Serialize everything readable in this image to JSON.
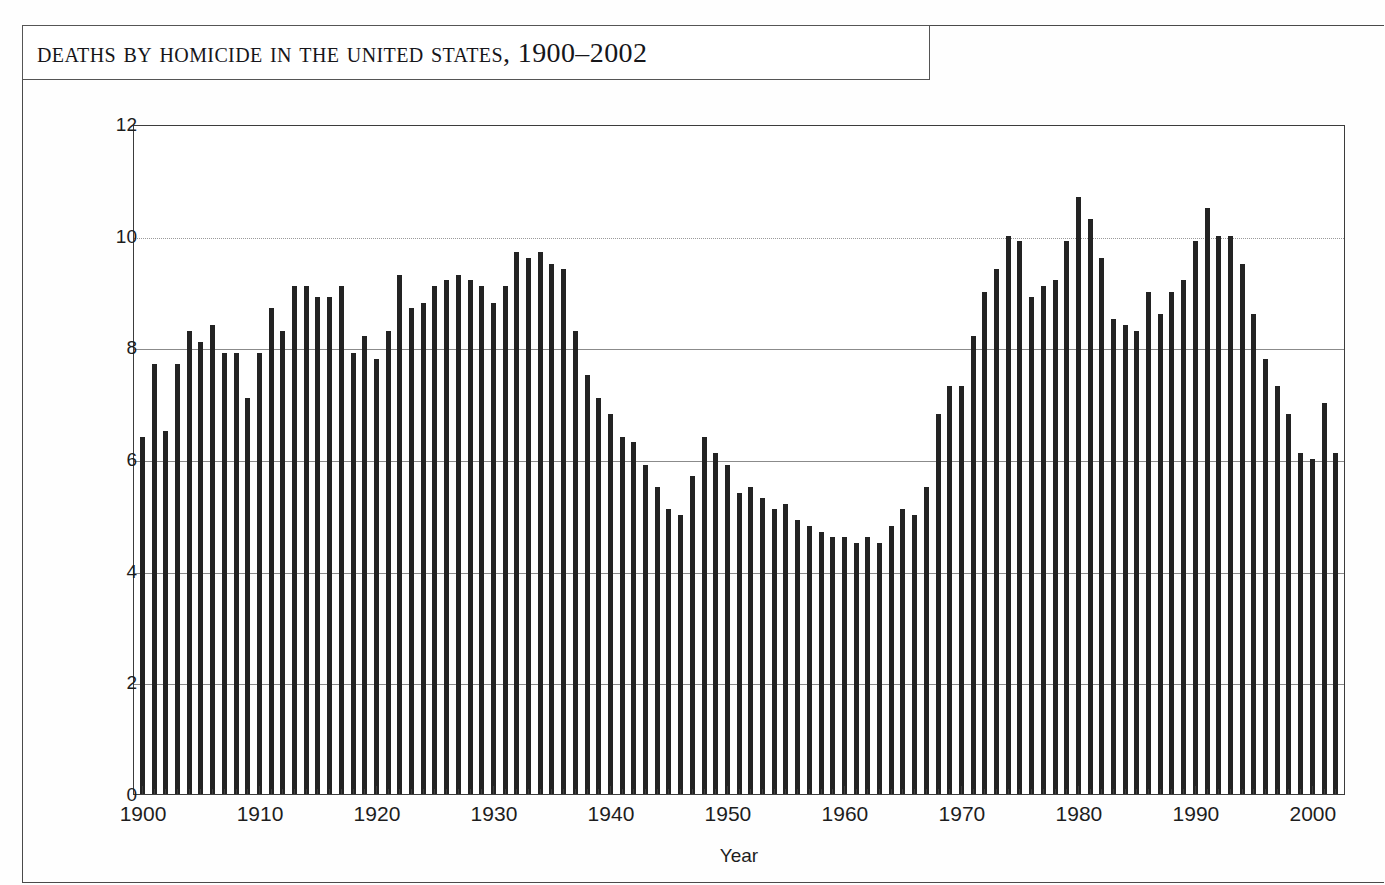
{
  "page": {
    "title_box_label": "Deaths by Homicide in the United States, 1900–2002"
  },
  "chart_data": {
    "type": "bar",
    "title": "Deaths by Homicide in the United States, 1900–2002",
    "xlabel": "Year",
    "ylabel": "Rate per 100,000 Residents",
    "ylim": [
      0,
      12
    ],
    "xlim": [
      1900,
      2002
    ],
    "ytick_labels": [
      "0",
      "2",
      "4",
      "6",
      "8",
      "10",
      "12"
    ],
    "ytick_values": [
      0,
      2,
      4,
      6,
      8,
      10,
      12
    ],
    "xtick_labels": [
      "1900",
      "1910",
      "1920",
      "1930",
      "1940",
      "1950",
      "1960",
      "1970",
      "1980",
      "1990",
      "2000"
    ],
    "xtick_values": [
      1900,
      1910,
      1920,
      1930,
      1940,
      1950,
      1960,
      1970,
      1980,
      1990,
      2000
    ],
    "grid": "horizontal",
    "legend": "none",
    "bar_color": "#232323",
    "categories": [
      1900,
      1901,
      1902,
      1903,
      1904,
      1905,
      1906,
      1907,
      1908,
      1909,
      1910,
      1911,
      1912,
      1913,
      1914,
      1915,
      1916,
      1917,
      1918,
      1919,
      1920,
      1921,
      1922,
      1923,
      1924,
      1925,
      1926,
      1927,
      1928,
      1929,
      1930,
      1931,
      1932,
      1933,
      1934,
      1935,
      1936,
      1937,
      1938,
      1939,
      1940,
      1941,
      1942,
      1943,
      1944,
      1945,
      1946,
      1947,
      1948,
      1949,
      1950,
      1951,
      1952,
      1953,
      1954,
      1955,
      1956,
      1957,
      1958,
      1959,
      1960,
      1961,
      1962,
      1963,
      1964,
      1965,
      1966,
      1967,
      1968,
      1969,
      1970,
      1971,
      1972,
      1973,
      1974,
      1975,
      1976,
      1977,
      1978,
      1979,
      1980,
      1981,
      1982,
      1983,
      1984,
      1985,
      1986,
      1987,
      1988,
      1989,
      1990,
      1991,
      1992,
      1993,
      1994,
      1995,
      1996,
      1997,
      1998,
      1999,
      2000,
      2001,
      2002
    ],
    "values": [
      6.4,
      7.7,
      6.5,
      7.7,
      8.3,
      8.1,
      8.4,
      7.9,
      7.9,
      7.1,
      7.9,
      8.7,
      8.3,
      9.1,
      9.1,
      8.9,
      8.9,
      9.1,
      7.9,
      8.2,
      7.8,
      8.3,
      9.3,
      8.7,
      8.8,
      9.1,
      9.2,
      9.3,
      9.2,
      9.1,
      8.8,
      9.1,
      9.7,
      9.6,
      9.7,
      9.5,
      9.4,
      8.3,
      7.5,
      7.1,
      6.8,
      6.4,
      6.3,
      5.9,
      5.5,
      5.1,
      5.0,
      5.7,
      6.4,
      6.1,
      5.9,
      5.4,
      5.5,
      5.3,
      5.1,
      5.2,
      4.9,
      4.8,
      4.7,
      4.6,
      4.6,
      4.5,
      4.6,
      4.5,
      4.8,
      5.1,
      5.0,
      5.5,
      6.8,
      7.3,
      7.3,
      8.2,
      9.0,
      9.4,
      10.0,
      9.9,
      8.9,
      9.1,
      9.2,
      9.9,
      10.7,
      10.3,
      9.6,
      8.5,
      8.4,
      8.3,
      9.0,
      8.6,
      9.0,
      9.2,
      9.9,
      10.5,
      10.0,
      10.0,
      9.5,
      8.6,
      7.8,
      7.3,
      6.8,
      6.1,
      6.0,
      7.0,
      6.1
    ]
  }
}
